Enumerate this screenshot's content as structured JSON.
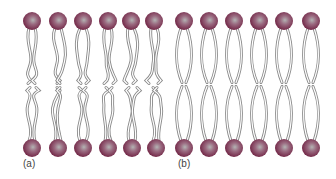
{
  "figure": {
    "panels": [
      {
        "id": "a",
        "label": "(a)",
        "description": "Lipid bilayer with unsaturated, kinked, disordered hydrocarbon tails",
        "label_pos": [
          23,
          167
        ],
        "heads_top_x": [
          32,
          58,
          83,
          108,
          131,
          154
        ],
        "heads_bottom_x": [
          32,
          58,
          83,
          108,
          132,
          156
        ],
        "tail_style": "kinked"
      },
      {
        "id": "b",
        "label": "(b)",
        "description": "Lipid bilayer with saturated, straight, ordered hydrocarbon tails",
        "label_pos": [
          178,
          167
        ],
        "heads_top_x": [
          184,
          209,
          234,
          259,
          284,
          311
        ],
        "heads_bottom_x": [
          184,
          209,
          234,
          259,
          284,
          311
        ],
        "tail_style": "straight"
      }
    ],
    "head_top_y": 21,
    "head_bottom_y": 148,
    "head_radius": 9,
    "colors": {
      "head_dark": "#7a2a48",
      "head_mid": "#a14a6a",
      "head_light": "#b7b7b7",
      "tail_stroke": "#8a8a8a",
      "tail_fill": "#ffffff",
      "label": "#444444",
      "background": "#ffffff"
    }
  }
}
